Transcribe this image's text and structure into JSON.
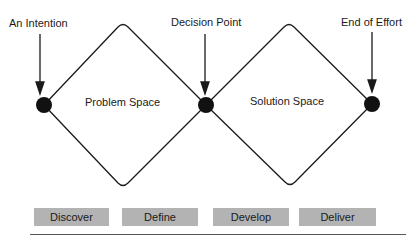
{
  "diagram": {
    "type": "double-diamond",
    "markers": [
      {
        "label": "An Intention"
      },
      {
        "label": "Decision Point"
      },
      {
        "label": "End of Effort"
      }
    ],
    "spaces": [
      {
        "label": "Problem Space"
      },
      {
        "label": "Solution Space"
      }
    ],
    "phases": [
      {
        "label": "Discover"
      },
      {
        "label": "Define"
      },
      {
        "label": "Develop"
      },
      {
        "label": "Deliver"
      }
    ],
    "colors": {
      "line": "#1a1a1a",
      "phase_box": "#b3b3b3",
      "background": "#ffffff"
    }
  }
}
